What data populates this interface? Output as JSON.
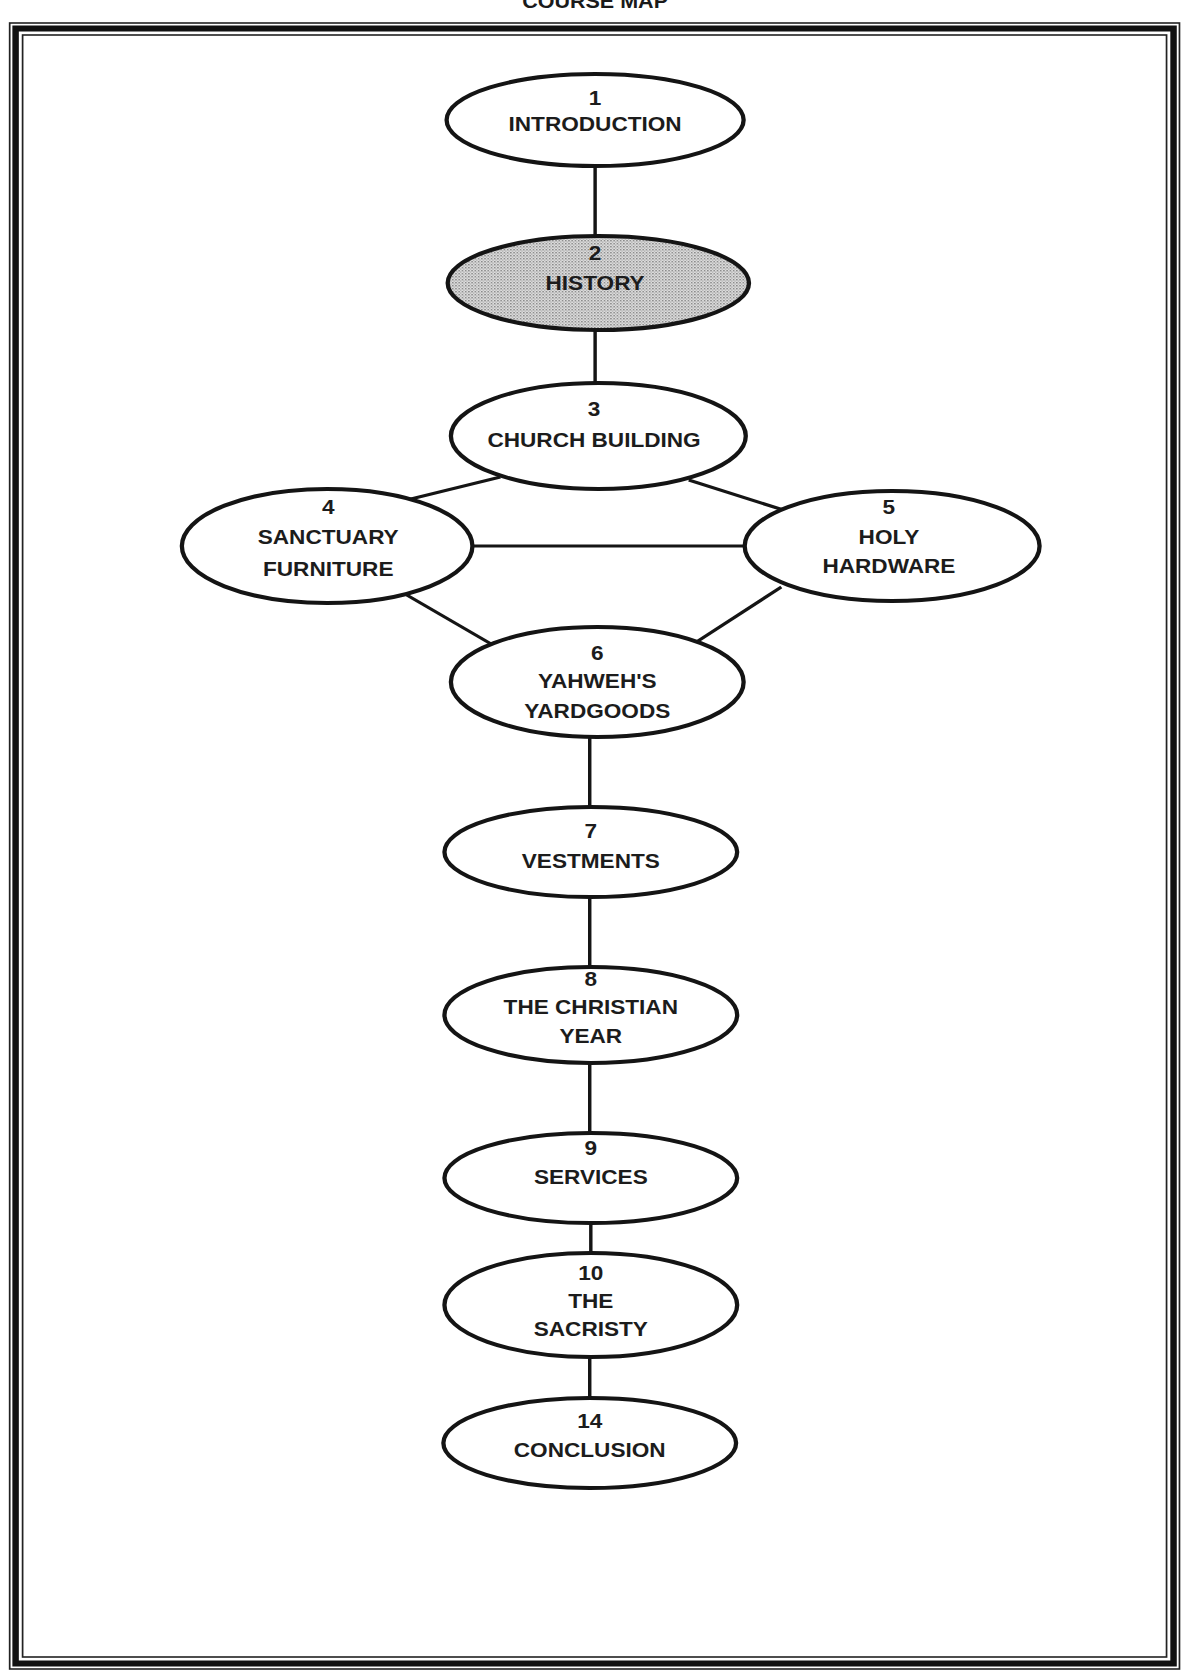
{
  "title": "COURSE MAP",
  "colors": {
    "ink": "#151515",
    "background": "#ffffff",
    "highlight_fill": "#c8c8c8"
  },
  "nodes": [
    {
      "id": "n1",
      "number": "1",
      "lines": [
        "INTRODUCTION"
      ],
      "highlighted": false
    },
    {
      "id": "n2",
      "number": "2",
      "lines": [
        "HISTORY"
      ],
      "highlighted": true
    },
    {
      "id": "n3",
      "number": "3",
      "lines": [
        "CHURCH BUILDING"
      ],
      "highlighted": false
    },
    {
      "id": "n4",
      "number": "4",
      "lines": [
        "SANCTUARY",
        "FURNITURE"
      ],
      "highlighted": false
    },
    {
      "id": "n5",
      "number": "5",
      "lines": [
        "HOLY",
        "HARDWARE"
      ],
      "highlighted": false
    },
    {
      "id": "n6",
      "number": "6",
      "lines": [
        "YAHWEH'S",
        "YARDGOODS"
      ],
      "highlighted": false
    },
    {
      "id": "n7",
      "number": "7",
      "lines": [
        "VESTMENTS"
      ],
      "highlighted": false
    },
    {
      "id": "n8",
      "number": "8",
      "lines": [
        "THE CHRISTIAN",
        "YEAR"
      ],
      "highlighted": false
    },
    {
      "id": "n9",
      "number": "9",
      "lines": [
        "SERVICES"
      ],
      "highlighted": false
    },
    {
      "id": "n10",
      "number": "10",
      "lines": [
        "THE",
        "SACRISTY"
      ],
      "highlighted": false
    },
    {
      "id": "n14",
      "number": "14",
      "lines": [
        "CONCLUSION"
      ],
      "highlighted": false
    }
  ],
  "edges": [
    [
      "n1",
      "n2"
    ],
    [
      "n2",
      "n3"
    ],
    [
      "n3",
      "n4"
    ],
    [
      "n3",
      "n5"
    ],
    [
      "n4",
      "n5"
    ],
    [
      "n4",
      "n6"
    ],
    [
      "n5",
      "n6"
    ],
    [
      "n6",
      "n7"
    ],
    [
      "n7",
      "n8"
    ],
    [
      "n8",
      "n9"
    ],
    [
      "n9",
      "n10"
    ],
    [
      "n10",
      "n14"
    ]
  ]
}
